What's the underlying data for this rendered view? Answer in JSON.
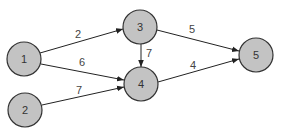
{
  "diagram": {
    "type": "weighted-directed-graph",
    "nodes": [
      {
        "id": "1",
        "label": "1",
        "x": 24,
        "y": 59
      },
      {
        "id": "2",
        "label": "2",
        "x": 25,
        "y": 110
      },
      {
        "id": "3",
        "label": "3",
        "x": 140,
        "y": 27
      },
      {
        "id": "4",
        "label": "4",
        "x": 141,
        "y": 84
      },
      {
        "id": "5",
        "label": "5",
        "x": 256,
        "y": 55
      }
    ],
    "edges": [
      {
        "from": "1",
        "to": "3",
        "weight": "2"
      },
      {
        "from": "1",
        "to": "4",
        "weight": "6"
      },
      {
        "from": "2",
        "to": "4",
        "weight": "7"
      },
      {
        "from": "3",
        "to": "4",
        "weight": "7"
      },
      {
        "from": "3",
        "to": "5",
        "weight": "5"
      },
      {
        "from": "4",
        "to": "5",
        "weight": "4"
      }
    ]
  }
}
